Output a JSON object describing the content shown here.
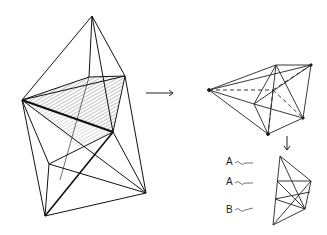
{
  "figure": {
    "labels": [
      {
        "text": "A",
        "x": 226,
        "y": 162
      },
      {
        "text": "A",
        "x": 226,
        "y": 182
      },
      {
        "text": "B",
        "x": 226,
        "y": 210
      }
    ],
    "stroke_color": "#111111",
    "background": "#ffffff"
  }
}
